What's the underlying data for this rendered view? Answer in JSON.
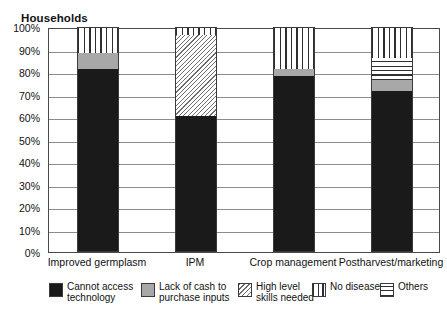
{
  "chart_data": {
    "type": "bar",
    "subtype": "stacked-percentage-column",
    "title": "Households",
    "xlabel": "",
    "ylabel": "",
    "ylim": [
      0,
      100
    ],
    "ytick_labels": [
      "100%",
      "90%",
      "80%",
      "70%",
      "60%",
      "50%",
      "40%",
      "30%",
      "20%",
      "10%",
      "0%"
    ],
    "ytick_values": [
      100,
      90,
      80,
      70,
      60,
      50,
      40,
      30,
      20,
      10,
      0
    ],
    "grid": true,
    "grid_axis": "y",
    "legend_position": "bottom",
    "categories": [
      "Improved germplasm",
      "IPM",
      "Crop management",
      "Postharvest/marketing"
    ],
    "series": [
      {
        "name": "Cannot access technology",
        "pattern": "solid-black",
        "color": "#1a1a1a",
        "values": [
          81,
          60,
          78,
          71
        ]
      },
      {
        "name": "Lack of cash to purchase inputs",
        "pattern": "solid-gray",
        "color": "#a8a8a8",
        "values": [
          7,
          0,
          3,
          5
        ]
      },
      {
        "name": "High level skills needed",
        "pattern": "diagonal-hatch",
        "color": "#6f6f6f",
        "values": [
          0,
          36,
          0,
          0
        ]
      },
      {
        "name": "No diseases",
        "pattern": "vertical-lines",
        "color": "#2f2f2f",
        "values": [
          12,
          4,
          19,
          14
        ]
      },
      {
        "name": "Others",
        "pattern": "horizontal-lines",
        "color": "#2f2f2f",
        "values": [
          0,
          0,
          0,
          10
        ]
      }
    ],
    "stack_order": [
      "Cannot access technology",
      "Lack of cash to purchase inputs",
      "High level skills needed",
      "Others",
      "No diseases"
    ]
  },
  "legend": {
    "items": [
      {
        "label": "Cannot access\ntechnology",
        "pattern": "solid-black"
      },
      {
        "label": "Lack of cash to\npurchase inputs",
        "pattern": "solid-gray"
      },
      {
        "label": "High level\nskills needed",
        "pattern": "diagonal-hatch"
      },
      {
        "label": "No diseases",
        "pattern": "vertical-lines"
      },
      {
        "label": "Others",
        "pattern": "horizontal-lines"
      }
    ]
  }
}
